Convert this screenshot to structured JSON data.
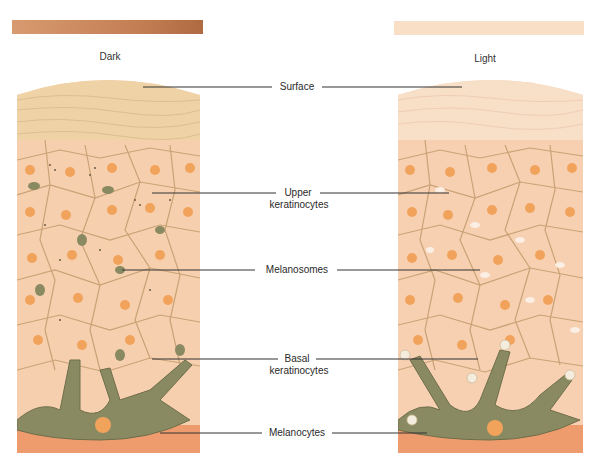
{
  "swatches": {
    "dark": {
      "label": "Dark",
      "color": "#c7865a"
    },
    "light": {
      "label": "Light",
      "color": "#f7dfc4"
    }
  },
  "labels": {
    "surface": "Surface",
    "upper_keratinocytes_1": "Upper",
    "upper_keratinocytes_2": "keratinocytes",
    "melanosomes": "Melanosomes",
    "basal_keratinocytes_1": "Basal",
    "basal_keratinocytes_2": "keratinocytes",
    "melanocytes": "Melanocytes"
  },
  "colors": {
    "surface_layer": "#f1d7ad",
    "cell_fill": "#f8d2b4",
    "cell_border": "#c9a275",
    "nucleus": "#f1a35c",
    "melanocyte": "#8a8a62",
    "dermis": "#ee9b6d"
  }
}
